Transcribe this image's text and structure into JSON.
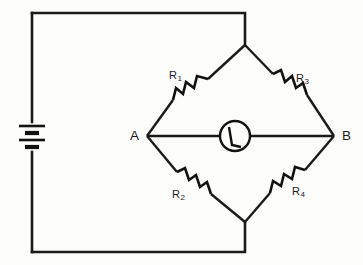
{
  "figure": {
    "kind": "wheatstone-bridge-circuit-diagram",
    "background_color": "#fdfdfc",
    "line_color": "#1a1a1a",
    "width": 363,
    "height": 265
  },
  "nodes": [
    {
      "id": "A",
      "label": "A",
      "position": "left-vertex"
    },
    {
      "id": "B",
      "label": "B",
      "position": "right-vertex"
    }
  ],
  "resistors": [
    {
      "id": "R1",
      "name": "R",
      "subscript": "1",
      "branch": "top-left"
    },
    {
      "id": "R3",
      "name": "R",
      "subscript": "3",
      "branch": "top-right"
    },
    {
      "id": "R2",
      "name": "R",
      "subscript": "2",
      "branch": "bottom-left"
    },
    {
      "id": "R4",
      "name": "R",
      "subscript": "4",
      "branch": "bottom-right"
    }
  ],
  "components": {
    "battery": {
      "name": "battery-cell",
      "cells": 2,
      "position": "left-side"
    },
    "galvanometer": {
      "name": "galvanometer",
      "position": "bridge-center"
    }
  }
}
